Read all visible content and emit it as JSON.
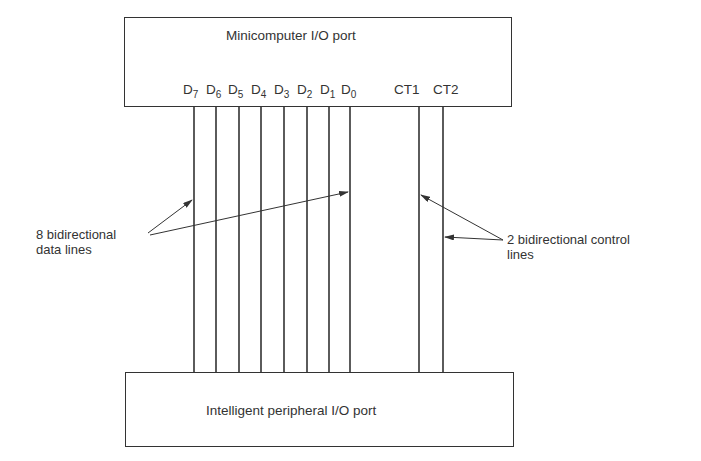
{
  "top_box": {
    "title": "Minicomputer I/O port"
  },
  "bottom_box": {
    "title": "Intelligent peripheral I/O port"
  },
  "data_lines": [
    {
      "base": "D",
      "sub": "7"
    },
    {
      "base": "D",
      "sub": "6"
    },
    {
      "base": "D",
      "sub": "5"
    },
    {
      "base": "D",
      "sub": "4"
    },
    {
      "base": "D",
      "sub": "3"
    },
    {
      "base": "D",
      "sub": "2"
    },
    {
      "base": "D",
      "sub": "1"
    },
    {
      "base": "D",
      "sub": "0"
    }
  ],
  "control_lines": [
    {
      "label": "CT1"
    },
    {
      "label": "CT2"
    }
  ],
  "annotations": {
    "data": {
      "line1": "8 bidirectional",
      "line2": "data lines"
    },
    "control": {
      "line1": "2 bidirectional control",
      "line2": "lines"
    }
  }
}
